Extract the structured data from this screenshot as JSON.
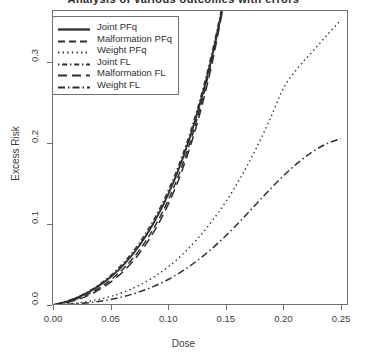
{
  "chart_data": {
    "type": "line",
    "title": "Analysis of various outcomes with errors",
    "xlabel": "Dose",
    "ylabel": "Excess Risk",
    "xlim": [
      0.0,
      0.25
    ],
    "ylim": [
      0.0,
      0.36
    ],
    "xticks": [
      "0.00",
      "0.05",
      "0.10",
      "0.15",
      "0.20",
      "0.25"
    ],
    "xtick_values": [
      0.0,
      0.05,
      0.1,
      0.15,
      0.2,
      0.25
    ],
    "yticks": [
      "0.0",
      "0.1",
      "0.2",
      "0.3"
    ],
    "ytick_values": [
      0.0,
      0.1,
      0.2,
      0.3
    ],
    "grid": false,
    "legend_position": "top-left",
    "line_color": "#2f2f2f",
    "frame_color": "#6e6e6e",
    "x": [
      0.0,
      0.0125,
      0.025,
      0.0375,
      0.05,
      0.0625,
      0.075,
      0.0875,
      0.1,
      0.1125,
      0.125,
      0.1375,
      0.15,
      0.1625,
      0.175,
      0.1875,
      0.2,
      0.2125,
      0.225,
      0.2375,
      0.25
    ],
    "series": [
      {
        "name": "Joint PFq",
        "dash": "solid",
        "width": 1.9,
        "values": [
          0.0,
          0.0045,
          0.0115,
          0.0215,
          0.0345,
          0.0515,
          0.0735,
          0.1015,
          0.1365,
          0.1805,
          0.2355,
          0.3035,
          0.3855,
          null,
          null,
          null,
          null,
          null,
          null,
          null,
          null
        ]
      },
      {
        "name": "Malformation PFq",
        "dash": "dashed-long",
        "width": 1.5,
        "values": [
          0.0,
          0.0038,
          0.0098,
          0.0188,
          0.0308,
          0.0468,
          0.0678,
          0.0948,
          0.1295,
          0.1735,
          0.2295,
          0.3005,
          0.3875,
          null,
          null,
          null,
          null,
          null,
          null,
          null,
          null
        ]
      },
      {
        "name": "Weight PFq",
        "dash": "dotted",
        "width": 1.4,
        "values": [
          0.0,
          0.0012,
          0.0032,
          0.0062,
          0.0105,
          0.0165,
          0.0245,
          0.0345,
          0.047,
          0.0625,
          0.081,
          0.1025,
          0.1275,
          0.1565,
          0.1895,
          0.2265,
          0.2675,
          0.2925,
          0.3125,
          0.3325,
          0.352
        ]
      },
      {
        "name": "Joint FL",
        "dash": "dashdot-short",
        "width": 1.4,
        "values": [
          0.0,
          0.0048,
          0.0122,
          0.0228,
          0.0365,
          0.0542,
          0.0768,
          0.1055,
          0.1412,
          0.1855,
          0.2405,
          0.3085,
          0.3905,
          null,
          null,
          null,
          null,
          null,
          null,
          null,
          null
        ]
      },
      {
        "name": "Malformation FL",
        "dash": "dashed-wide",
        "width": 1.5,
        "values": [
          0.0,
          0.0032,
          0.0085,
          0.0168,
          0.0282,
          0.0435,
          0.0638,
          0.0902,
          0.1242,
          0.1678,
          0.2235,
          0.2945,
          0.3845,
          null,
          null,
          null,
          null,
          null,
          null,
          null,
          null
        ]
      },
      {
        "name": "Weight FL",
        "dash": "dashdot-long",
        "width": 1.5,
        "values": [
          0.0,
          0.0008,
          0.002,
          0.004,
          0.0068,
          0.0108,
          0.0162,
          0.023,
          0.0315,
          0.042,
          0.0545,
          0.069,
          0.0855,
          0.1035,
          0.1225,
          0.1415,
          0.1595,
          0.1755,
          0.189,
          0.199,
          0.2055
        ]
      }
    ]
  }
}
